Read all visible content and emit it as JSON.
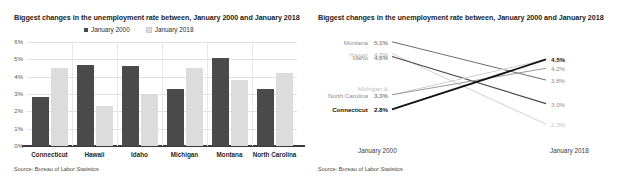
{
  "left_chart": {
    "title": "Biggest changes in the unemployment rate between, January 2000 and January 2018",
    "source": "Source: Bureau of Labor Statistics",
    "legend": [
      {
        "label": "January 2000",
        "color": "#4a4a4a"
      },
      {
        "label": "January 2018",
        "color": "#dcdcdc"
      }
    ],
    "yticks": [
      "0%",
      "1%",
      "2%",
      "3%",
      "4%",
      "5%",
      "6%"
    ],
    "categories": [
      "Connecticut",
      "Hawaii",
      "Idaho",
      "Michigan",
      "Montana",
      "North Carolina"
    ],
    "chart_data": {
      "type": "bar",
      "title": "Biggest changes in the unemployment rate between, January 2000 and January 2018",
      "xlabel": "",
      "ylabel": "",
      "ylim": [
        0,
        6
      ],
      "ytick_values": [
        0,
        1,
        2,
        3,
        4,
        5,
        6
      ],
      "ytick_labels": [
        "0%",
        "1%",
        "2%",
        "3%",
        "4%",
        "5%",
        "6%"
      ],
      "grid": true,
      "legend_position": "top-center",
      "categories": [
        "Connecticut",
        "Hawaii",
        "Idaho",
        "Michigan",
        "Montana",
        "North Carolina"
      ],
      "series": [
        {
          "name": "January 2000",
          "color": "#4a4a4a",
          "values": [
            2.8,
            4.7,
            4.6,
            3.3,
            5.1,
            3.3
          ]
        },
        {
          "name": "January 2018",
          "color": "#dcdcdc",
          "values": [
            4.5,
            2.3,
            3.0,
            4.5,
            3.8,
            4.2
          ]
        }
      ]
    }
  },
  "right_chart": {
    "title": "Biggest changes in the unemployment rate between, January 2000 and January 2018",
    "source": "Source: Bureau of Labor Statistics",
    "left_axis_label": "January 2000",
    "right_axis_label": "January 2018",
    "left_labels": [
      {
        "name": "Montana",
        "value": "5.1%",
        "color": "#8c8c8c",
        "bold": false
      },
      {
        "name": "Hawaii",
        "value": "4.7%",
        "color": "#c2c2c2",
        "bold": false
      },
      {
        "name": "Idaho",
        "value": "4.6%",
        "color": "#8c8c8c",
        "bold": false
      },
      {
        "name": "Michigan &",
        "value": "",
        "color": "#c2c2c2",
        "bold": false
      },
      {
        "name": "North Carolina",
        "value": "3.3%",
        "color": "#8c8c8c",
        "bold": false
      },
      {
        "name": "Connecticut",
        "value": "2.8%",
        "color": "#111111",
        "bold": true
      }
    ],
    "right_labels": [
      {
        "value": "4.5%",
        "color": "#111111",
        "bold": true
      },
      {
        "value": "4.2%",
        "color": "#8c8c8c",
        "bold": false
      },
      {
        "value": "3.8%",
        "color": "#8c8c8c",
        "bold": false
      },
      {
        "value": "3.0%",
        "color": "#8c8c8c",
        "bold": false
      },
      {
        "value": "2.3%",
        "color": "#c2c2c2",
        "bold": false
      }
    ],
    "chart_data": {
      "type": "line",
      "subtype": "slope",
      "title": "Biggest changes in the unemployment rate between, January 2000 and January 2018",
      "x": [
        "January 2000",
        "January 2018"
      ],
      "xlabel": "",
      "ylabel": "",
      "ylim": [
        2.0,
        5.4
      ],
      "grid": false,
      "legend_position": "inline-labels",
      "series": [
        {
          "name": "Montana",
          "values": [
            5.1,
            3.8
          ],
          "color": "#6e6e6e",
          "width": 1.0
        },
        {
          "name": "Hawaii",
          "values": [
            4.7,
            2.3
          ],
          "color": "#d2d2d2",
          "width": 1.0
        },
        {
          "name": "Idaho",
          "values": [
            4.6,
            3.0
          ],
          "color": "#4a4a4a",
          "width": 1.2
        },
        {
          "name": "Michigan",
          "values": [
            3.3,
            4.5
          ],
          "color": "#cfcfcf",
          "width": 1.0
        },
        {
          "name": "North Carolina",
          "values": [
            3.3,
            4.2
          ],
          "color": "#9a9a9a",
          "width": 1.0
        },
        {
          "name": "Connecticut",
          "values": [
            2.8,
            4.5
          ],
          "color": "#111111",
          "width": 1.8
        }
      ]
    }
  }
}
